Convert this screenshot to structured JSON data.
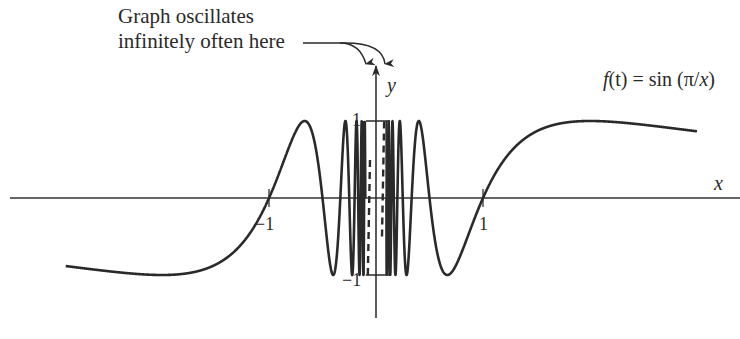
{
  "annotation": {
    "line1": "Graph oscillates",
    "line2": "infinitely often here"
  },
  "axes": {
    "x_label": "x",
    "y_label": "y",
    "ticks": {
      "x_neg1": "−1",
      "x_pos1": "1",
      "y_pos1": "1",
      "y_neg1": "−1"
    }
  },
  "function_label": {
    "f": "f",
    "arg": "(t)",
    "rhs": " = sin (π/",
    "var": "x",
    "close": ")"
  },
  "plot": {
    "origin_px": [
      376,
      198
    ],
    "x_scale_px": 107,
    "y_scale_px": 77,
    "x_range": [
      -3.0,
      3.0
    ],
    "x_axis_px": [
      10,
      752
    ],
    "y_axis_px": [
      318,
      66
    ],
    "left_curve_start": -3.0,
    "right_curve_end": 3.0,
    "cutoff": 0.1,
    "box": {
      "x0": -0.095,
      "x1": 0.095
    },
    "stroke": "#2a2a2a"
  },
  "chart_data": {
    "type": "line",
    "xlabel": "x",
    "ylabel": "y",
    "ylim": [
      -1,
      1
    ],
    "x_ticks": [
      -1,
      1
    ],
    "y_ticks": [
      -1,
      1
    ],
    "annotations": [
      "Graph oscillates infinitely often here"
    ],
    "series": [
      {
        "name": "sin(π/x)",
        "function": "sin(pi/x)",
        "x": [
          -3,
          -2,
          -1.5,
          -1,
          -0.667,
          -0.5,
          -0.4,
          -0.333,
          -0.286,
          -0.25,
          0.25,
          0.286,
          0.333,
          0.4,
          0.5,
          0.667,
          1,
          1.5,
          2,
          3
        ],
        "y": [
          -0.866,
          -1,
          -0.866,
          0,
          0.866,
          0,
          -1,
          0,
          1,
          0,
          0,
          -1,
          0,
          1,
          0,
          -1,
          0,
          0.866,
          1,
          0.866
        ]
      }
    ]
  }
}
